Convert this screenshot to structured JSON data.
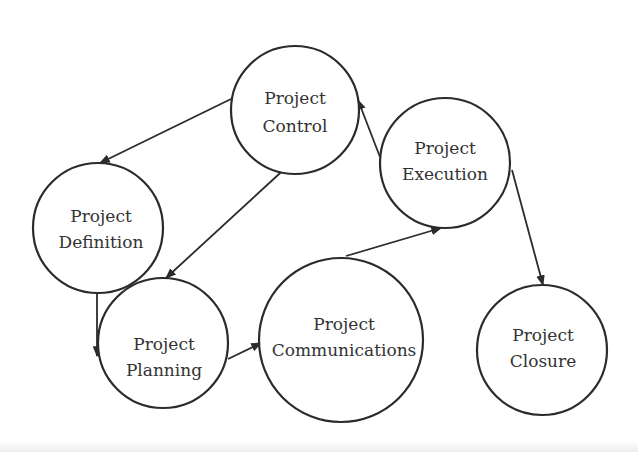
{
  "diagram": {
    "type": "process-cycle",
    "nodes": [
      {
        "id": "control",
        "line1": "Project",
        "line2": "Control",
        "cx": 295,
        "cy": 110,
        "r": 64
      },
      {
        "id": "execution",
        "line1": "Project",
        "line2": "Execution",
        "cx": 445,
        "cy": 163,
        "r": 65
      },
      {
        "id": "definition",
        "line1": "Project",
        "line2": "Definition",
        "cx": 98,
        "cy": 228,
        "r": 65
      },
      {
        "id": "planning",
        "line1": "Project",
        "line2": "Planning",
        "cx": 163,
        "cy": 343,
        "r": 65
      },
      {
        "id": "communications",
        "line1": "Project",
        "line2": "Communications",
        "cx": 341,
        "cy": 350,
        "r": 82
      },
      {
        "id": "closure",
        "line1": "Project",
        "line2": "Closure",
        "cx": 542,
        "cy": 352,
        "r": 65
      }
    ],
    "edges": [
      {
        "from": "control",
        "to": "definition"
      },
      {
        "from": "control",
        "to": "planning"
      },
      {
        "from": "definition",
        "to": "planning"
      },
      {
        "from": "planning",
        "to": "communications"
      },
      {
        "from": "communications",
        "to": "execution"
      },
      {
        "from": "execution",
        "to": "control"
      },
      {
        "from": "execution",
        "to": "closure"
      }
    ]
  }
}
